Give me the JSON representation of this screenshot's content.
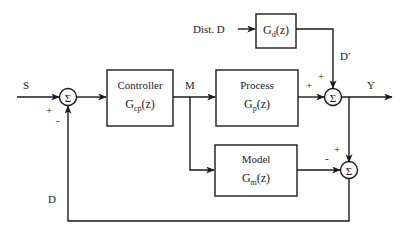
{
  "diagram": {
    "type": "block-diagram",
    "blocks": [
      {
        "id": "controller",
        "name": "Controller",
        "tf_main": "G",
        "tf_sub": "cp",
        "tf_arg": "(z)"
      },
      {
        "id": "process",
        "name": "Process",
        "tf_main": "G",
        "tf_sub": "p",
        "tf_arg": "(z)"
      },
      {
        "id": "model",
        "name": "Model",
        "tf_main": "G",
        "tf_sub": "m",
        "tf_arg": "(z)"
      },
      {
        "id": "disturbance",
        "name": "",
        "tf_main": "G",
        "tf_sub": "d",
        "tf_arg": "(z)"
      }
    ],
    "summing_junctions": [
      {
        "id": "sum-setpoint",
        "symbol": "Σ",
        "signs": [
          "+",
          "-"
        ]
      },
      {
        "id": "sum-output",
        "symbol": "Σ",
        "signs": [
          "+",
          "+"
        ]
      },
      {
        "id": "sum-model-error",
        "symbol": "Σ",
        "signs": [
          "+",
          "-"
        ]
      }
    ],
    "signals": {
      "setpoint": "S",
      "manipulated": "M",
      "output": "Y",
      "disturbance_input": "Dist. D",
      "disturbance_effect": "D′",
      "feedback": "D"
    }
  }
}
